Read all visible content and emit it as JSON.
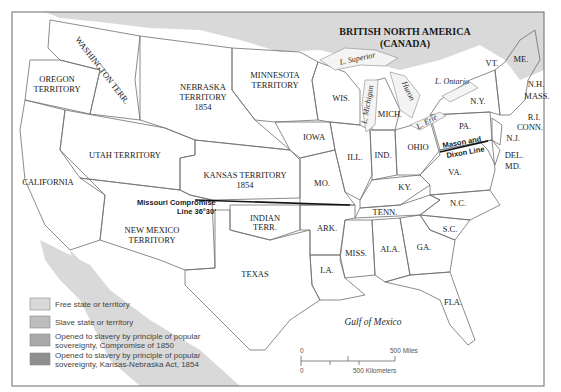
{
  "map": {
    "title_region": "BRITISH NORTH AMERICA",
    "title_region_sub": "(CANADA)",
    "colors": {
      "free": "#d9d9d9",
      "slave": "#bdbdbd",
      "compromise_1850": "#a9a9a9",
      "kansas_nebraska_1854": "#8f8f8f",
      "water": "#ffffff",
      "frame": "#6a6a6a"
    },
    "territories": {
      "washington": "WASHINGTON TERR.",
      "oregon_1": "OREGON",
      "oregon_2": "TERRITORY",
      "nebraska_1": "NEBRASKA",
      "nebraska_2": "TERRITORY",
      "nebraska_3": "1854",
      "minnesota_1": "MINNESOTA",
      "minnesota_2": "TERRITORY",
      "utah": "UTAH TERRITORY",
      "kansas_1": "KANSAS TERRITORY",
      "kansas_2": "1854",
      "california": "CALIFORNIA",
      "new_mexico_1": "NEW MEXICO",
      "new_mexico_2": "TERRITORY",
      "indian_1": "INDIAN",
      "indian_2": "TERR.",
      "texas": "TEXAS"
    },
    "states": {
      "wis": "WIS.",
      "mich": "MICH.",
      "iowa": "IOWA",
      "ill": "ILL.",
      "ind": "IND.",
      "ohio": "OHIO",
      "pa": "PA.",
      "ny": "N.Y.",
      "vt": "VT.",
      "me": "ME.",
      "nh": "N.H.",
      "mass": "MASS.",
      "ri": "R.I.",
      "conn": "CONN.",
      "nj": "N.J.",
      "del": "DEL.",
      "md": "MD.",
      "va": "VA.",
      "ky": "KY.",
      "mo": "MO.",
      "tenn": "TENN.",
      "nc": "N.C.",
      "sc": "S.C.",
      "ark": "ARK.",
      "miss": "MISS.",
      "ala": "ALA.",
      "ga": "GA.",
      "la": "LA.",
      "fla": "FLA."
    },
    "lakes": {
      "superior": "L. Superior",
      "michigan": "L. Michigan",
      "huron": "Huron",
      "erie": "L. Erie",
      "ontario": "L. Ontario"
    },
    "water_bodies": {
      "gulf": "Gulf of Mexico"
    },
    "lines": {
      "missouri_compromise_1": "Missouri Compromise",
      "missouri_compromise_2": "Line 36°30′",
      "mason_dixon_1": "Mason and",
      "mason_dixon_2": "Dixon Line"
    },
    "scale": {
      "miles_zero": "0",
      "miles_label": "500 Miles",
      "km_zero": "0",
      "km_label": "500 Kilometers"
    },
    "legend": [
      {
        "label_1": "Free state or territory",
        "label_2": "",
        "color": "#d9d9d9"
      },
      {
        "label_1": "Slave state or territory",
        "label_2": "",
        "color": "#bdbdbd"
      },
      {
        "label_1": "Opened to slavery by principle of popular",
        "label_2": "sovereignty, Compromise of 1850",
        "color": "#a9a9a9"
      },
      {
        "label_1": "Opened to slavery by principle of popular",
        "label_2": "sovereignty, Kansas-Nebraska Act, 1854",
        "color": "#8f8f8f"
      }
    ]
  }
}
